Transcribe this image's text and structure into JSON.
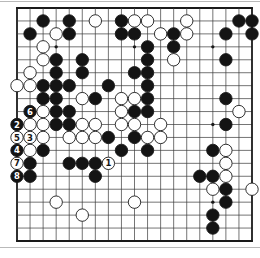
{
  "board": {
    "size": 19,
    "colors": {
      "background": "#ffffff",
      "line": "#3a3a3a",
      "border": "#1a1a1a",
      "stone_black": "#141414",
      "stone_white": "#ffffff",
      "stone_outline": "#1a1a1a",
      "page_edge": "#b9b9b9"
    },
    "hoshi_visible": [
      [
        4,
        4
      ],
      [
        10,
        4
      ],
      [
        16,
        4
      ],
      [
        16,
        10
      ],
      [
        16,
        16
      ]
    ],
    "black_stones": [
      [
        3,
        2
      ],
      [
        5,
        2
      ],
      [
        9,
        2
      ],
      [
        18,
        2
      ],
      [
        19,
        2
      ],
      [
        2,
        3
      ],
      [
        5,
        3
      ],
      [
        9,
        3
      ],
      [
        10,
        3
      ],
      [
        13,
        3
      ],
      [
        17,
        3
      ],
      [
        19,
        3
      ],
      [
        11,
        4
      ],
      [
        13,
        4
      ],
      [
        4,
        5
      ],
      [
        6,
        5
      ],
      [
        11,
        5
      ],
      [
        17,
        5
      ],
      [
        4,
        6
      ],
      [
        6,
        6
      ],
      [
        10,
        6
      ],
      [
        11,
        6
      ],
      [
        3,
        7
      ],
      [
        4,
        7
      ],
      [
        5,
        7
      ],
      [
        8,
        7
      ],
      [
        11,
        7
      ],
      [
        3,
        8
      ],
      [
        4,
        8
      ],
      [
        7,
        8
      ],
      [
        11,
        8
      ],
      [
        17,
        8
      ],
      [
        4,
        9
      ],
      [
        5,
        9
      ],
      [
        10,
        9
      ],
      [
        11,
        9
      ],
      [
        4,
        10
      ],
      [
        5,
        10
      ],
      [
        17,
        10
      ],
      [
        8,
        11
      ],
      [
        10,
        11
      ],
      [
        3,
        12
      ],
      [
        9,
        12
      ],
      [
        11,
        12
      ],
      [
        16,
        12
      ],
      [
        2,
        13
      ],
      [
        5,
        13
      ],
      [
        6,
        13
      ],
      [
        7,
        13
      ],
      [
        2,
        14
      ],
      [
        7,
        14
      ],
      [
        15,
        14
      ],
      [
        16,
        14
      ],
      [
        17,
        15
      ],
      [
        17,
        16
      ],
      [
        16,
        17
      ],
      [
        16,
        18
      ]
    ],
    "white_stones": [
      [
        7,
        2
      ],
      [
        10,
        2
      ],
      [
        11,
        2
      ],
      [
        14,
        2
      ],
      [
        4,
        3
      ],
      [
        12,
        3
      ],
      [
        14,
        3
      ],
      [
        3,
        4
      ],
      [
        3,
        5
      ],
      [
        13,
        5
      ],
      [
        2,
        6
      ],
      [
        1,
        7
      ],
      [
        2,
        7
      ],
      [
        6,
        8
      ],
      [
        9,
        8
      ],
      [
        10,
        8
      ],
      [
        3,
        9
      ],
      [
        9,
        9
      ],
      [
        18,
        9
      ],
      [
        2,
        10
      ],
      [
        3,
        10
      ],
      [
        6,
        10
      ],
      [
        7,
        10
      ],
      [
        9,
        10
      ],
      [
        10,
        10
      ],
      [
        12,
        10
      ],
      [
        3,
        11
      ],
      [
        5,
        11
      ],
      [
        6,
        11
      ],
      [
        7,
        11
      ],
      [
        11,
        11
      ],
      [
        12,
        11
      ],
      [
        2,
        12
      ],
      [
        17,
        12
      ],
      [
        17,
        13
      ],
      [
        17,
        14
      ],
      [
        16,
        15
      ],
      [
        19,
        15
      ],
      [
        4,
        16
      ],
      [
        10,
        16
      ],
      [
        6,
        17
      ]
    ],
    "labeled_moves": [
      {
        "n": "1",
        "color": "white",
        "col": 8,
        "row": 13
      },
      {
        "n": "2",
        "color": "black",
        "col": 1,
        "row": 10
      },
      {
        "n": "3",
        "color": "white",
        "col": 2,
        "row": 11
      },
      {
        "n": "4",
        "color": "black",
        "col": 1,
        "row": 12
      },
      {
        "n": "5",
        "color": "white",
        "col": 1,
        "row": 11
      },
      {
        "n": "6",
        "color": "black",
        "col": 2,
        "row": 9
      },
      {
        "n": "7",
        "color": "white",
        "col": 1,
        "row": 13
      },
      {
        "n": "8",
        "color": "black",
        "col": 1,
        "row": 14
      }
    ]
  }
}
